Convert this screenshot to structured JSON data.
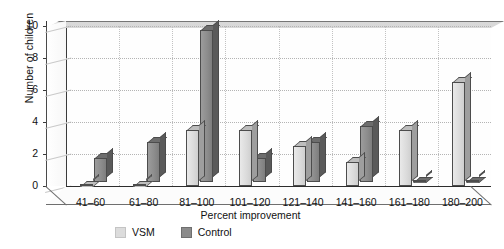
{
  "chart_data": {
    "type": "bar",
    "title": "",
    "xlabel": "Percent improvement",
    "ylabel": "Number of children",
    "categories": [
      "41–60",
      "61–80",
      "81–100",
      "101–120",
      "121–140",
      "141–160",
      "161–180",
      "180–200"
    ],
    "series": [
      {
        "name": "VSM",
        "color": "#dcdcdc",
        "values": [
          0,
          0,
          3.5,
          3.5,
          2.5,
          1.5,
          3.5,
          6.5
        ]
      },
      {
        "name": "Control",
        "color": "#8b8b8b",
        "values": [
          1.5,
          2.5,
          9.5,
          1.5,
          2.5,
          3.5,
          0,
          0
        ]
      }
    ],
    "ylim": [
      0,
      10
    ],
    "yticks": [
      0,
      2,
      4,
      6,
      8,
      10
    ],
    "ytick_labels": [
      "0",
      "2",
      "4",
      "6",
      "8",
      "10"
    ],
    "grid": true,
    "grid_axis": "y",
    "legend_position": "bottom",
    "style": "3d-clustered-column"
  },
  "legend": {
    "items": [
      {
        "label": "VSM",
        "swatch": "vsm-swatch"
      },
      {
        "label": "Control",
        "swatch": "control-swatch"
      }
    ]
  },
  "axes": {
    "y_title": "Number of children",
    "x_title": "Percent improvement"
  }
}
